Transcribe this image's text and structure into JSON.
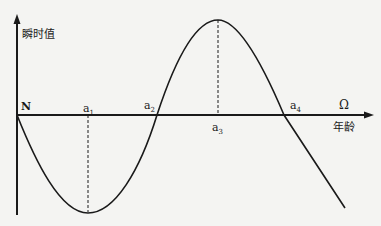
{
  "diagram": {
    "y_axis_label": "瞬时值",
    "x_axis_label": "年龄",
    "x_axis_end_symbol": "Ω",
    "origin_label": "N",
    "points": [
      {
        "base": "a",
        "sub": "1"
      },
      {
        "base": "a",
        "sub": "2"
      },
      {
        "base": "a",
        "sub": "3"
      },
      {
        "base": "a",
        "sub": "4"
      }
    ],
    "colors": {
      "line": "#1a1a1a",
      "background": "#f4f4f2"
    }
  }
}
